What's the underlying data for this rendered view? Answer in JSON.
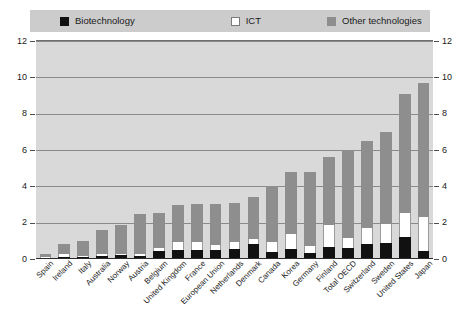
{
  "legend": {
    "items": [
      {
        "label": "Biotechnology",
        "color": "#111111",
        "key": "biotechnology"
      },
      {
        "label": "ICT",
        "color": "#ffffff",
        "key": "ict"
      },
      {
        "label": "Other technologies",
        "color": "#8e8e8e",
        "key": "other"
      }
    ]
  },
  "axes": {
    "y_ticks": [
      "0",
      "2",
      "4",
      "6",
      "8",
      "10",
      "12"
    ],
    "y_ticks_right": [
      "0",
      "2",
      "4",
      "6",
      "8",
      "10",
      "12"
    ]
  },
  "chart_data": {
    "type": "bar",
    "stacked": true,
    "title": "",
    "subtitle": "",
    "xlabel": "",
    "ylabel": "",
    "ylim": [
      0,
      12
    ],
    "ytick_step": 2,
    "grid": true,
    "legend_position": "top",
    "categories": [
      "Spain",
      "Ireland",
      "Italy",
      "Australia",
      "Norway",
      "Austria",
      "Belgium",
      "United Kingdom",
      "France",
      "European Union",
      "Netherlands",
      "Denmark",
      "Canada",
      "Korea",
      "Germany",
      "Finland",
      "Total OECD",
      "Switzerland",
      "Sweden",
      "United States",
      "Japan"
    ],
    "series": [
      {
        "name": "Biotechnology",
        "color": "#111111",
        "values": [
          0.05,
          0.1,
          0.12,
          0.18,
          0.2,
          0.15,
          0.45,
          0.5,
          0.5,
          0.5,
          0.55,
          0.85,
          0.4,
          0.55,
          0.35,
          0.65,
          0.6,
          0.85,
          0.9,
          1.2,
          0.45
        ]
      },
      {
        "name": "ICT",
        "color": "#ffffff",
        "values": [
          0.05,
          0.15,
          0.05,
          0.1,
          0.1,
          0.12,
          0.15,
          0.45,
          0.45,
          0.25,
          0.4,
          0.25,
          0.55,
          0.85,
          0.35,
          1.25,
          0.55,
          0.85,
          1.05,
          1.35,
          1.85
        ]
      },
      {
        "name": "Other technologies",
        "color": "#8e8e8e",
        "values": [
          0.2,
          0.6,
          0.83,
          1.32,
          1.6,
          2.23,
          1.95,
          2.0,
          2.1,
          2.3,
          2.15,
          2.3,
          3.05,
          3.4,
          4.1,
          3.7,
          4.85,
          4.8,
          5.05,
          6.55,
          7.4
        ]
      }
    ],
    "totals": [
      0.3,
      0.85,
      1.0,
      1.6,
      1.9,
      2.5,
      2.55,
      2.95,
      3.05,
      3.05,
      3.1,
      3.4,
      4.0,
      4.8,
      4.8,
      5.6,
      6.0,
      6.5,
      7.0,
      9.1,
      9.7
    ]
  }
}
